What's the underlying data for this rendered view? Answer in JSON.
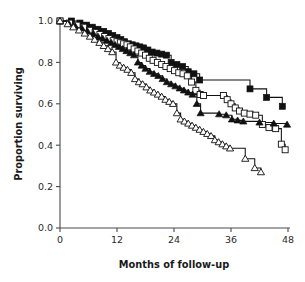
{
  "chart_data": {
    "type": "line",
    "title": "",
    "subtitle": "",
    "xlabel": "Months of follow-up",
    "ylabel": "Proportion surviving",
    "xlim": [
      0,
      48
    ],
    "ylim": [
      0.0,
      1.0
    ],
    "xticks": [
      0,
      12,
      24,
      36,
      48
    ],
    "xticklabels": [
      "0",
      "12",
      "24",
      "36",
      "48"
    ],
    "yticks": [
      0.0,
      0.2,
      0.4,
      0.6,
      0.8,
      1.0
    ],
    "yticklabels": [
      "0.0",
      "0.2",
      "0.4",
      "0.6",
      "0.8",
      "1.0"
    ],
    "grid": false,
    "legend": "none",
    "plot_style": "kaplan-meier step survival curves with censoring markers",
    "series": [
      {
        "name": "Group 1",
        "marker": "filled-square",
        "marker_fill": "#111111",
        "marker_edge": "#111111",
        "line_color": "#111111",
        "x": [
          0,
          2.4,
          4.2,
          5.6,
          6.8,
          8.0,
          9.2,
          10.2,
          11.1,
          12.0,
          12.8,
          13.6,
          14.4,
          15.2,
          16.0,
          16.8,
          17.6,
          18.5,
          19.4,
          20.4,
          21.4,
          22.4,
          23.4,
          24.6,
          25.8,
          27.0,
          28.2,
          29.4,
          40.0,
          43.5,
          46.8
        ],
        "y": [
          1.0,
          1.0,
          0.99,
          0.98,
          0.97,
          0.96,
          0.95,
          0.94,
          0.93,
          0.92,
          0.91,
          0.9,
          0.89,
          0.885,
          0.88,
          0.875,
          0.87,
          0.86,
          0.85,
          0.845,
          0.84,
          0.835,
          0.8,
          0.79,
          0.78,
          0.755,
          0.745,
          0.715,
          0.672,
          0.631,
          0.588
        ]
      },
      {
        "name": "Group 2",
        "marker": "open-square",
        "marker_fill": "#ffffff",
        "marker_edge": "#111111",
        "line_color": "#111111",
        "x": [
          0,
          2.0,
          3.6,
          5.0,
          6.2,
          7.4,
          8.4,
          9.4,
          10.3,
          11.2,
          12.0,
          12.7,
          13.4,
          14.1,
          14.8,
          15.6,
          16.4,
          17.2,
          18.0,
          18.8,
          19.6,
          20.5,
          21.4,
          22.3,
          23.2,
          24.1,
          25.0,
          25.9,
          26.8,
          27.7,
          28.6,
          29.5,
          30.2,
          34.4,
          35.2,
          36.0,
          36.9,
          37.8,
          38.8,
          40.0,
          41.2,
          42.6,
          44.0,
          45.4,
          46.6,
          47.4
        ],
        "y": [
          1.0,
          0.99,
          0.98,
          0.97,
          0.955,
          0.945,
          0.935,
          0.925,
          0.915,
          0.905,
          0.9,
          0.895,
          0.89,
          0.885,
          0.875,
          0.865,
          0.855,
          0.845,
          0.835,
          0.82,
          0.81,
          0.8,
          0.79,
          0.78,
          0.77,
          0.76,
          0.75,
          0.745,
          0.735,
          0.705,
          0.665,
          0.645,
          0.64,
          0.64,
          0.62,
          0.6,
          0.58,
          0.565,
          0.555,
          0.55,
          0.545,
          0.5,
          0.485,
          0.48,
          0.405,
          0.378
        ]
      },
      {
        "name": "Group 3",
        "marker": "filled-triangle",
        "marker_fill": "#111111",
        "marker_edge": "#111111",
        "line_color": "#111111",
        "x": [
          0,
          1.8,
          3.2,
          4.6,
          5.8,
          7.0,
          8.0,
          9.0,
          9.9,
          10.8,
          11.6,
          12.4,
          13.2,
          14.0,
          14.8,
          15.6,
          16.4,
          17.2,
          18.0,
          18.9,
          19.8,
          20.7,
          21.6,
          22.5,
          23.4,
          24.3,
          25.2,
          26.1,
          27.0,
          27.9,
          28.8,
          29.6,
          33.5,
          35.0,
          36.2,
          37.4,
          38.6,
          42.0,
          45.0,
          47.8
        ],
        "y": [
          1.0,
          0.99,
          0.975,
          0.965,
          0.95,
          0.94,
          0.925,
          0.915,
          0.905,
          0.895,
          0.885,
          0.875,
          0.865,
          0.855,
          0.845,
          0.835,
          0.8,
          0.785,
          0.77,
          0.755,
          0.745,
          0.735,
          0.72,
          0.705,
          0.695,
          0.685,
          0.675,
          0.665,
          0.655,
          0.645,
          0.6,
          0.555,
          0.55,
          0.545,
          0.525,
          0.52,
          0.515,
          0.51,
          0.505,
          0.5
        ]
      },
      {
        "name": "Group 4",
        "marker": "open-triangle",
        "marker_fill": "#ffffff",
        "marker_edge": "#111111",
        "line_color": "#111111",
        "x": [
          0,
          1.6,
          2.8,
          4.0,
          5.2,
          6.3,
          7.3,
          8.3,
          9.2,
          10.1,
          11.0,
          11.8,
          12.6,
          13.4,
          14.2,
          15.0,
          15.8,
          16.6,
          17.4,
          18.2,
          19.0,
          19.8,
          20.6,
          21.4,
          22.2,
          23.0,
          23.8,
          24.6,
          25.4,
          26.2,
          27.0,
          27.8,
          28.6,
          29.4,
          30.2,
          31.0,
          31.8,
          32.6,
          33.4,
          34.2,
          35.0,
          35.8,
          39.0,
          41.0,
          42.3
        ],
        "y": [
          1.0,
          0.985,
          0.97,
          0.955,
          0.94,
          0.925,
          0.91,
          0.895,
          0.88,
          0.865,
          0.85,
          0.8,
          0.785,
          0.775,
          0.765,
          0.75,
          0.72,
          0.705,
          0.695,
          0.68,
          0.665,
          0.655,
          0.645,
          0.635,
          0.62,
          0.61,
          0.6,
          0.555,
          0.525,
          0.515,
          0.505,
          0.495,
          0.485,
          0.475,
          0.465,
          0.455,
          0.445,
          0.425,
          0.415,
          0.405,
          0.395,
          0.385,
          0.335,
          0.29,
          0.27
        ]
      }
    ]
  }
}
